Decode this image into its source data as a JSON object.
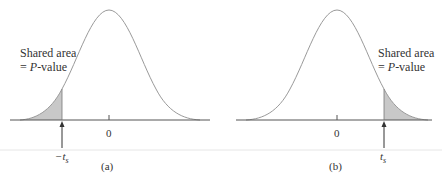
{
  "panels": [
    {
      "id": "a",
      "caption": "(a)",
      "annotation_line1": "Shared area",
      "annotation_line2_prefix": "= ",
      "annotation_line2_italic": "P",
      "annotation_line2_suffix": "-value",
      "center_tick_label": "0",
      "critical_label": "−t",
      "critical_subscript": "s",
      "tail": "left"
    },
    {
      "id": "b",
      "caption": "(b)",
      "annotation_line1": "Shared area",
      "annotation_line2_prefix": "= ",
      "annotation_line2_italic": "P",
      "annotation_line2_suffix": "-value",
      "center_tick_label": "0",
      "critical_label": "t",
      "critical_subscript": "s",
      "tail": "right"
    }
  ],
  "colors": {
    "curve": "#9a9a9a",
    "axis": "#555555",
    "shade": "#c8c8c8",
    "separator": "#e6e6e6"
  }
}
